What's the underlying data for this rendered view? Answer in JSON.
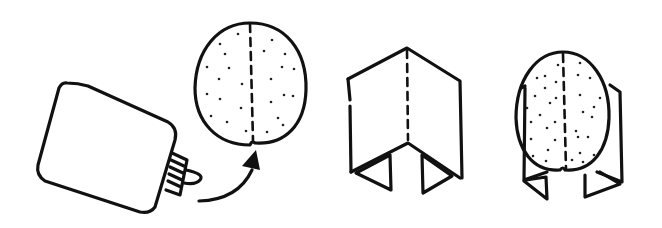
{
  "illustration": {
    "description": "Four-step line-art instructions: glue bottle, dotted oval shape with arrow, folded card, oval glued onto folded card",
    "steps": [
      {
        "name": "glue-bottle"
      },
      {
        "name": "dotted-oval-with-arrow"
      },
      {
        "name": "folded-card"
      },
      {
        "name": "oval-on-folded-card"
      }
    ],
    "colors": {
      "stroke": "#111111",
      "background": "#ffffff"
    }
  }
}
